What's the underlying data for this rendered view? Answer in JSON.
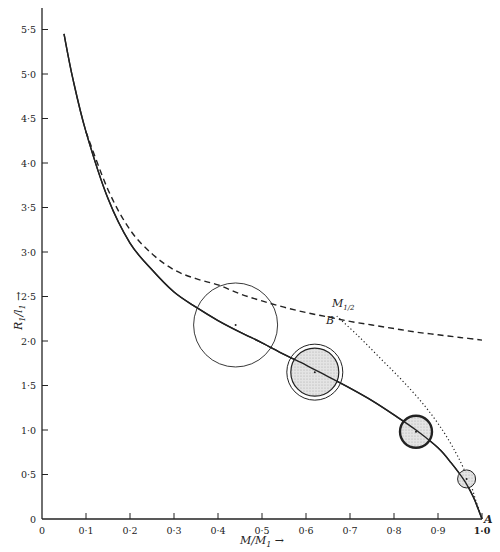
{
  "chart_data": {
    "type": "line",
    "title": "",
    "xlabel": "M/M₁ →",
    "ylabel": "R₁/l₁ →",
    "xlim": [
      0,
      1.0
    ],
    "ylim": [
      0,
      5.5
    ],
    "grid": false,
    "legend": null,
    "x_ticks": [
      "0",
      "0·1",
      "0·2",
      "0·3",
      "0·4",
      "0·5",
      "0·6",
      "0·7",
      "0·8",
      "0·9",
      "1·0"
    ],
    "y_ticks": [
      "0",
      "0·5",
      "1·0",
      "1·5",
      "2·0",
      "2·5",
      "3·0",
      "3·5",
      "4·0",
      "4·5",
      "5·0",
      "5·5"
    ],
    "series": [
      {
        "name": "solid-curve",
        "style": "solid",
        "x": [
          0.05,
          0.07,
          0.1,
          0.15,
          0.2,
          0.25,
          0.3,
          0.35,
          0.4,
          0.45,
          0.5,
          0.55,
          0.6,
          0.65,
          0.7,
          0.75,
          0.8,
          0.85,
          0.9,
          0.93,
          0.96,
          0.98,
          0.99,
          1.0
        ],
        "y": [
          5.45,
          4.95,
          4.35,
          3.6,
          3.1,
          2.8,
          2.55,
          2.38,
          2.23,
          2.1,
          1.98,
          1.85,
          1.73,
          1.6,
          1.47,
          1.33,
          1.17,
          1.0,
          0.8,
          0.63,
          0.43,
          0.25,
          0.13,
          0.0
        ]
      },
      {
        "name": "dashed-curve",
        "style": "dashed",
        "x": [
          0.1,
          0.15,
          0.2,
          0.25,
          0.3,
          0.35,
          0.4,
          0.45,
          0.5,
          0.55,
          0.6,
          0.65,
          0.7,
          0.75,
          0.8,
          0.85,
          0.9,
          0.95,
          1.0
        ],
        "y": [
          4.35,
          3.7,
          3.25,
          2.98,
          2.8,
          2.7,
          2.63,
          2.53,
          2.45,
          2.38,
          2.32,
          2.27,
          2.22,
          2.18,
          2.14,
          2.1,
          2.07,
          2.04,
          2.01
        ]
      },
      {
        "name": "dotted-curve",
        "style": "dotted",
        "x": [
          0.67,
          0.72,
          0.77,
          0.82,
          0.87,
          0.91,
          0.94,
          0.96,
          0.975,
          0.985,
          0.995,
          1.0
        ],
        "y": [
          2.28,
          2.05,
          1.8,
          1.55,
          1.27,
          1.0,
          0.75,
          0.55,
          0.38,
          0.22,
          0.08,
          0.0
        ]
      }
    ],
    "circles": [
      {
        "cx": 0.44,
        "cy": 2.18,
        "r_px": 42,
        "fill": "none",
        "ring": false
      },
      {
        "cx": 0.62,
        "cy": 1.65,
        "r_px": 28,
        "fill": "stippled",
        "ring": true
      },
      {
        "cx": 0.85,
        "cy": 0.98,
        "r_px": 16,
        "fill": "stippled",
        "ring": false,
        "thick_border": true
      },
      {
        "cx": 0.965,
        "cy": 0.45,
        "r_px": 9,
        "fill": "stippled",
        "ring": false
      }
    ],
    "annotations": [
      {
        "text": "M₁/₂",
        "x": 0.66,
        "y": 2.35
      },
      {
        "text": "B",
        "x": 0.65,
        "y": 2.15
      },
      {
        "text": "A",
        "x": 1.0,
        "y": 0.0
      }
    ]
  },
  "labels": {
    "xlabel_main": "M/M",
    "xlabel_sub": "1",
    "ylabel_main": "R",
    "ylabel_sub1": "1",
    "ylabel_mid": "/l",
    "ylabel_sub2": "1",
    "annot_m_half": "M",
    "annot_m_half_sub": "1/2",
    "annot_b": "B",
    "annot_a": "A"
  },
  "colors": {
    "ink": "#222222",
    "stipple": "#d8d8d8",
    "background": "#ffffff"
  }
}
